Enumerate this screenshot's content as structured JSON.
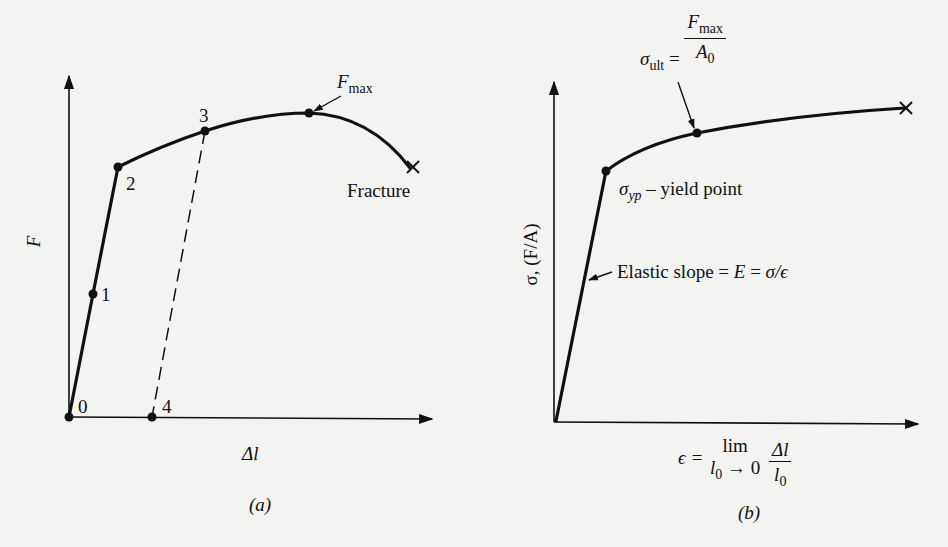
{
  "figure_a": {
    "y_axis_label": "F",
    "x_axis_label": "Δl",
    "caption": "(a)",
    "points": [
      {
        "id": "p0",
        "label": "0"
      },
      {
        "id": "p1",
        "label": "1"
      },
      {
        "id": "p2",
        "label": "2"
      },
      {
        "id": "p3",
        "label": "3"
      },
      {
        "id": "p4",
        "label": "4"
      }
    ],
    "fmax_label_main": "F",
    "fmax_label_sub": "max",
    "fracture_label": "Fracture"
  },
  "figure_b": {
    "y_axis_label": "σ, (F/A)",
    "x_axis_label": {
      "lhs": "ϵ =",
      "lim_top": "lim",
      "lim_bottom_var": "l",
      "lim_bottom_sub": "0",
      "lim_bottom_rest": "→ 0",
      "frac_num": "Δl",
      "frac_den_var": "l",
      "frac_den_sub": "0"
    },
    "caption": "(b)",
    "ultimate_label": {
      "sigma": "σ",
      "sub": "ult",
      "eq": "=",
      "num_main": "F",
      "num_sub": "max",
      "den_main": "A",
      "den_sub": "0"
    },
    "yield_label": {
      "sigma": "σ",
      "sub": "yp",
      "text": "– yield point"
    },
    "elastic_label": {
      "text": "Elastic slope = ",
      "E": "E",
      "eq": " = ",
      "rhs": "σ/ϵ"
    }
  }
}
